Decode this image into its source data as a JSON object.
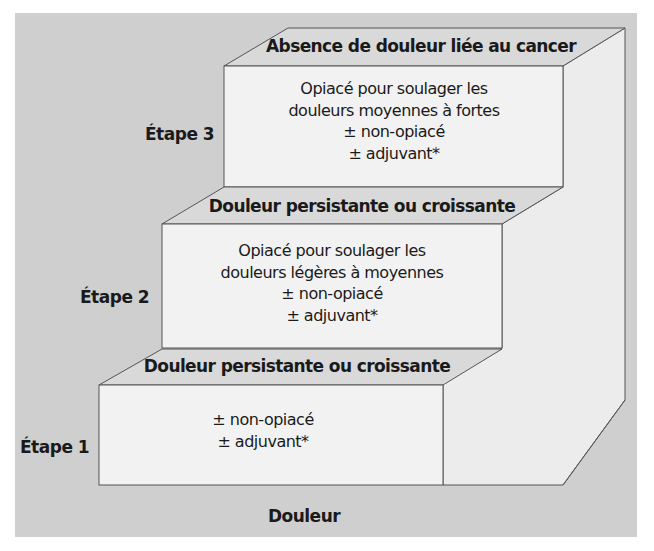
{
  "diagram": {
    "title_bottom": "Douleur",
    "colors": {
      "background": "#cfcfcf",
      "front_face": "#f2f2f2",
      "top_face": "#d9d9d9",
      "side_face": "#ececec",
      "stroke": "#555555",
      "text": "#1a1a1a"
    },
    "steps": [
      {
        "label": "Étape 1",
        "top_label": "Douleur persistante ou croissante",
        "lines": [
          "± non-opiacé",
          "± adjuvant*"
        ]
      },
      {
        "label": "Étape 2",
        "top_label": "Douleur persistante ou croissante",
        "lines": [
          "Opiacé pour soulager les",
          "douleurs légères à moyennes",
          "± non-opiacé",
          "± adjuvant*"
        ]
      },
      {
        "label": "Étape 3",
        "top_label": "Absence de douleur liée au cancer",
        "lines": [
          "Opiacé pour soulager les",
          "douleurs moyennes à fortes",
          "± non-opiacé",
          "± adjuvant*"
        ]
      }
    ]
  }
}
